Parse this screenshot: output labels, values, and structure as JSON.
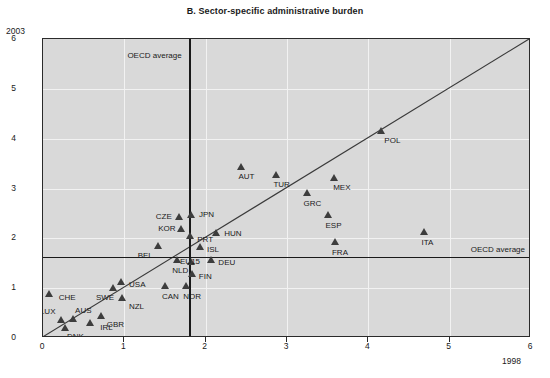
{
  "chart_data": {
    "type": "scatter",
    "title": "B. Sector-specific administrative burden",
    "xlabel": "1998",
    "ylabel": "2003",
    "xlim": [
      0,
      6
    ],
    "ylim": [
      0,
      6
    ],
    "xticks": [
      0,
      1,
      2,
      3,
      4,
      5,
      6
    ],
    "yticks": [
      0,
      1,
      2,
      3,
      4,
      5,
      6
    ],
    "grid": true,
    "legend": "none",
    "annotations": [
      {
        "name": "oecd-average-vertical",
        "label": "OECD average",
        "axis": "x",
        "value": 1.8
      },
      {
        "name": "oecd-average-horizontal",
        "label": "OECD average",
        "axis": "y",
        "value": 1.63
      },
      {
        "name": "diagonal-45-line",
        "label": "",
        "from": [
          0,
          0
        ],
        "to": [
          6,
          6
        ]
      }
    ],
    "points": [
      {
        "label": "CHE",
        "x": 0.07,
        "y": 0.82,
        "lx": 10,
        "ly": 5
      },
      {
        "label": "LUX",
        "x": 0.22,
        "y": 0.3,
        "lx": -21,
        "ly": -7
      },
      {
        "label": "AUS",
        "x": 0.37,
        "y": 0.32,
        "lx": 2,
        "ly": -7
      },
      {
        "label": "DNK",
        "x": 0.27,
        "y": 0.14,
        "lx": 2,
        "ly": 10
      },
      {
        "label": "IRL",
        "x": 0.58,
        "y": 0.24,
        "lx": 10,
        "ly": 6
      },
      {
        "label": "GBR",
        "x": 0.71,
        "y": 0.38,
        "lx": 6,
        "ly": 10
      },
      {
        "label": "SWE",
        "x": 0.86,
        "y": 0.94,
        "lx": -17,
        "ly": 11
      },
      {
        "label": "USA",
        "x": 0.96,
        "y": 1.06,
        "lx": 8,
        "ly": 4
      },
      {
        "label": "NZL",
        "x": 0.97,
        "y": 0.74,
        "lx": 7,
        "ly": 10
      },
      {
        "label": "BEL",
        "x": 1.41,
        "y": 1.79,
        "lx": -20,
        "ly": 11
      },
      {
        "label": "CAN",
        "x": 1.5,
        "y": 0.98,
        "lx": -3,
        "ly": 12
      },
      {
        "label": "NLD",
        "x": 1.65,
        "y": 1.5,
        "lx": -5,
        "ly": 12
      },
      {
        "label": "CZE",
        "x": 1.67,
        "y": 2.37,
        "lx": -23,
        "ly": 1
      },
      {
        "label": "KOR",
        "x": 1.7,
        "y": 2.13,
        "lx": -23,
        "ly": 1
      },
      {
        "label": "NOR",
        "x": 1.76,
        "y": 0.98,
        "lx": -3,
        "ly": 12
      },
      {
        "label": "JPN",
        "x": 1.82,
        "y": 2.41,
        "lx": 8,
        "ly": 1
      },
      {
        "label": "PRT",
        "x": 1.81,
        "y": 1.99,
        "lx": 7,
        "ly": 5
      },
      {
        "label": "EU15",
        "x": 1.82,
        "y": 1.47,
        "lx": -11,
        "ly": 1
      },
      {
        "label": "FIN",
        "x": 1.83,
        "y": 1.23,
        "lx": 7,
        "ly": 4
      },
      {
        "label": "ISL",
        "x": 1.93,
        "y": 1.77,
        "lx": 7,
        "ly": 4
      },
      {
        "label": "DEU",
        "x": 2.07,
        "y": 1.5,
        "lx": 7,
        "ly": 4
      },
      {
        "label": "HUN",
        "x": 2.13,
        "y": 2.05,
        "lx": 8,
        "ly": 2
      },
      {
        "label": "AUT",
        "x": 2.44,
        "y": 3.37,
        "lx": -3,
        "ly": 11
      },
      {
        "label": "TUR",
        "x": 2.87,
        "y": 3.21,
        "lx": -3,
        "ly": 11
      },
      {
        "label": "GRC",
        "x": 3.24,
        "y": 2.85,
        "lx": -3,
        "ly": 12
      },
      {
        "label": "ESP",
        "x": 3.51,
        "y": 2.41,
        "lx": -3,
        "ly": 12
      },
      {
        "label": "MEX",
        "x": 3.58,
        "y": 3.15,
        "lx": -1,
        "ly": 11
      },
      {
        "label": "FRA",
        "x": 3.59,
        "y": 1.87,
        "lx": -3,
        "ly": 12
      },
      {
        "label": "POL",
        "x": 4.16,
        "y": 4.1,
        "lx": 3,
        "ly": 11
      },
      {
        "label": "ITA",
        "x": 4.69,
        "y": 2.07,
        "lx": -3,
        "ly": 12
      }
    ]
  }
}
